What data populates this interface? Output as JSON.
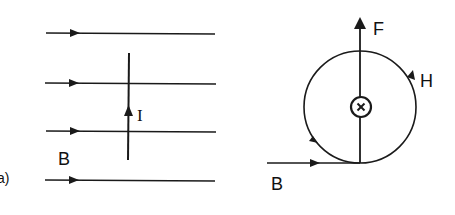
{
  "figure": {
    "part_label": "a)",
    "left_panel": {
      "field_label": "B",
      "current_label": "I",
      "field_lines": 4
    },
    "right_panel": {
      "force_label": "F",
      "circulating_field_label": "H",
      "field_label": "B",
      "wire_symbol": "current-into-page"
    },
    "colors": {
      "stroke": "#1a1a1a",
      "background": "#ffffff"
    }
  }
}
